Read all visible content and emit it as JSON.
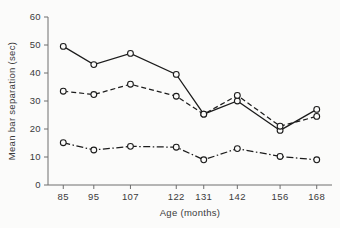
{
  "chart_data": {
    "type": "line",
    "title": "",
    "xlabel": "Age (months)",
    "ylabel": "Mean bar separation (sec)",
    "categories": [
      "85",
      "95",
      "107",
      "122",
      "131",
      "142",
      "156",
      "168"
    ],
    "x": [
      85,
      95,
      107,
      122,
      131,
      142,
      156,
      168
    ],
    "xlim": [
      80,
      173
    ],
    "ylim": [
      0,
      60
    ],
    "yticks": [
      0,
      10,
      20,
      30,
      40,
      50,
      60
    ],
    "ytick_labels": [
      "0",
      "10",
      "20",
      "30",
      "40",
      "50",
      "60"
    ],
    "xtick_labels": [
      "85",
      "95",
      "107",
      "122",
      "131",
      "142",
      "156",
      "168"
    ],
    "grid": false,
    "legend": "none",
    "marker": "open-circle",
    "series": [
      {
        "name": "series-solid",
        "linestyle": "solid",
        "color": "#1c1c1c",
        "values": [
          49.5,
          43.0,
          47.0,
          39.5,
          25.3,
          30.0,
          19.5,
          27.0
        ]
      },
      {
        "name": "series-dashed",
        "linestyle": "dashed",
        "color": "#1c1c1c",
        "values": [
          33.5,
          32.3,
          36.0,
          31.7,
          25.3,
          32.0,
          21.0,
          24.5
        ]
      },
      {
        "name": "series-dashdot",
        "linestyle": "dashdot",
        "color": "#1c1c1c",
        "values": [
          15.1,
          12.5,
          13.8,
          13.5,
          9.0,
          13.0,
          10.2,
          9.0
        ]
      }
    ]
  }
}
